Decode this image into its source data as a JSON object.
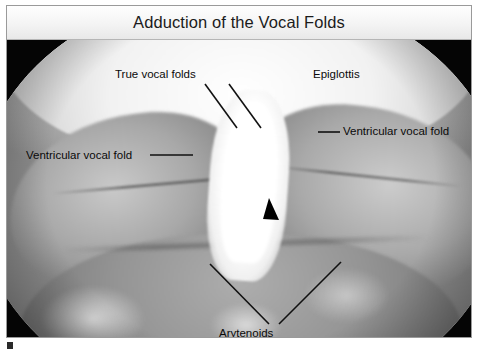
{
  "figure": {
    "title": "Adduction of the Vocal Folds",
    "image_kind": "endoscopic-laryngoscopy-photograph",
    "view": "superior view of the larynx through a laryngoscope",
    "colors": {
      "frame_border": "#9a9a9a",
      "title_bar_bg": "#f4f4f4",
      "title_text": "#1b1b1b",
      "photo_backdrop": "#050505",
      "annotation_line": "#111111",
      "annotation_text": "#0a0a0a",
      "glottis_highlight": "#ffffff"
    }
  },
  "annotations": [
    {
      "id": "true-vocal-folds",
      "label": "True vocal folds",
      "text_x": 108,
      "text_y": 63,
      "leaders": [
        {
          "x1": 198,
          "y1": 78,
          "x2": 230,
          "y2": 122
        },
        {
          "x1": 222,
          "y1": 78,
          "x2": 254,
          "y2": 122
        }
      ]
    },
    {
      "id": "epiglottis",
      "label": "Epiglottis",
      "text_x": 306,
      "text_y": 63,
      "leaders": []
    },
    {
      "id": "ventricular-vocal-fold-right",
      "label": "Ventricular vocal fold",
      "text_x": 336,
      "text_y": 120,
      "leaders": [
        {
          "x1": 311,
          "y1": 126,
          "x2": 333,
          "y2": 126
        }
      ]
    },
    {
      "id": "ventricular-vocal-fold-left",
      "label": "Ventricular vocal fold",
      "text_x": 19,
      "text_y": 144,
      "leaders": [
        {
          "x1": 143,
          "y1": 149,
          "x2": 186,
          "y2": 149
        }
      ]
    },
    {
      "id": "arytenoids",
      "label": "Arytenoids",
      "text_x": 212,
      "text_y": 322,
      "leaders": [
        {
          "x1": 203,
          "y1": 258,
          "x2": 262,
          "y2": 318
        },
        {
          "x1": 334,
          "y1": 256,
          "x2": 272,
          "y2": 318
        }
      ]
    }
  ],
  "markers": {
    "glottis_wedge": {
      "id": "glottis-pointer-wedge",
      "description": "black triangular wedge marking the posterior glottic chink",
      "points": "262,192 272,214 256,213"
    }
  }
}
